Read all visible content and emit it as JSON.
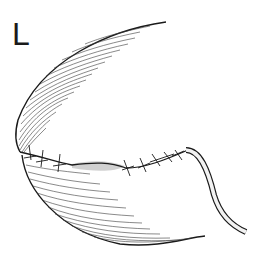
{
  "figure": {
    "panel_label": "L",
    "colors": {
      "line": "#1a1a1a",
      "hatch": "#3a3a3a",
      "shade": "#bdbdbd",
      "background": "#ffffff"
    },
    "elements": [
      {
        "name": "organ-outline-upper",
        "description": "upper curved contour"
      },
      {
        "name": "organ-outline-lower",
        "description": "lower curved contour"
      },
      {
        "name": "suture-line",
        "description": "running suture with interrupted stitches"
      },
      {
        "name": "drain-tube",
        "description": "tube exiting right end of suture line"
      }
    ]
  }
}
